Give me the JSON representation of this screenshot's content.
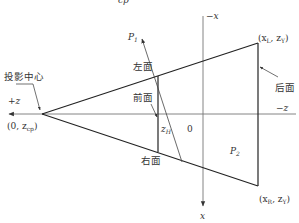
{
  "diagram": {
    "title_fragment": "z_cp",
    "labels": {
      "projection_center": "投影中心",
      "left_face": "左面",
      "front_face": "前面",
      "right_face": "右面",
      "back_face": "后面",
      "plus_z": "+z",
      "minus_z": "−z",
      "minus_x": "−x",
      "x": "x",
      "origin": "0",
      "z_h_main": "z",
      "z_h_sub": "H",
      "p1_main": "P",
      "p1_sub": "1",
      "p2_main": "P",
      "p2_sub": "2",
      "proj_point": "(0, z",
      "proj_point_sub": "cp",
      "proj_point_end": ")",
      "left_corner_a": "(x",
      "left_corner_sub1": "L",
      "left_corner_b": ", z",
      "left_corner_sub2": "Y",
      "left_corner_end": ")",
      "right_corner_a": "(x",
      "right_corner_sub1": "R",
      "right_corner_b": ", z",
      "right_corner_sub2": "Y",
      "right_corner_end": ")"
    },
    "colors": {
      "line": "#222222",
      "axis": "#666666",
      "text": "#333333"
    }
  }
}
